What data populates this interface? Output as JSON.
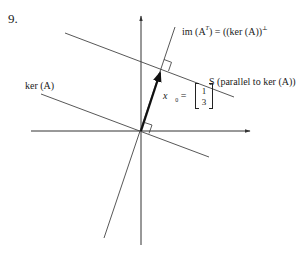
{
  "problem_number": "9.",
  "labels": {
    "image_transpose": {
      "prefix": "im (A",
      "sup": "T",
      "suffix": ") = ((ker (A))",
      "perp": "⊥",
      "close": ""
    },
    "kernel": "ker (A)",
    "S_line": "S (parallel to ker (A))",
    "vector": {
      "name": "x⃗",
      "subscript": "0",
      "equals": "=",
      "components": [
        "1",
        "3"
      ]
    }
  },
  "geometry": {
    "origin": [
      141,
      131
    ],
    "x_axis": {
      "from": [
        31,
        131
      ],
      "to": [
        250,
        131
      ]
    },
    "y_axis": {
      "from": [
        141,
        245
      ],
      "to": [
        141,
        16
      ]
    },
    "image_transpose_line": {
      "from": [
        104,
        238
      ],
      "to": [
        175,
        27
      ]
    },
    "kernel_line": {
      "from": [
        41,
        94
      ],
      "to": [
        209,
        157
      ]
    },
    "S_line": {
      "from": [
        65,
        33
      ],
      "to": [
        234,
        97
      ]
    },
    "vector_x0": {
      "from": [
        141,
        131
      ],
      "to": [
        161,
        69
      ]
    }
  },
  "colors": {
    "line": "#333333",
    "vector": "#111111",
    "background": "#ffffff"
  }
}
